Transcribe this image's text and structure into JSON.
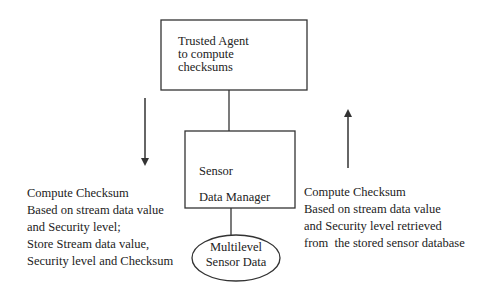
{
  "diagram": {
    "nodes": [
      {
        "id": "trusted-agent",
        "shape": "rectangle",
        "lines": [
          "Trusted Agent",
          "to compute",
          "checksums"
        ]
      },
      {
        "id": "sensor-data-manager",
        "shape": "rectangle",
        "lines": [
          "Sensor",
          "Data Manager"
        ]
      },
      {
        "id": "multilevel-sensor-data",
        "shape": "ellipse",
        "lines": [
          "Multilevel",
          "Sensor Data"
        ]
      }
    ],
    "edges": [
      {
        "from": "trusted-agent",
        "to": "sensor-data-manager",
        "type": "line"
      },
      {
        "from": "sensor-data-manager",
        "to": "multilevel-sensor-data",
        "type": "line"
      }
    ],
    "flows": [
      {
        "id": "store-flow",
        "direction": "down",
        "side": "left",
        "lines": [
          "Compute Checksum",
          "Based on stream data value",
          "and Security level;",
          "Store Stream data value,",
          "Security level and Checksum"
        ]
      },
      {
        "id": "retrieve-flow",
        "direction": "up",
        "side": "right",
        "lines": [
          "Compute Checksum",
          "Based on stream data value",
          "and Security level retrieved",
          "from  the stored sensor database"
        ]
      }
    ],
    "stroke_color": "#333333"
  }
}
